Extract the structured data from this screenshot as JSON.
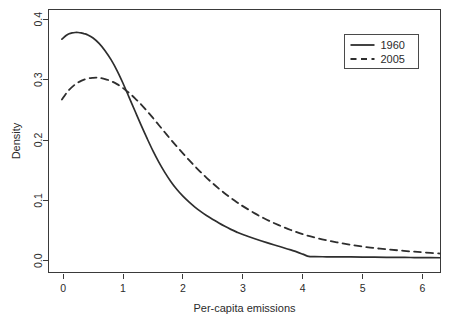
{
  "chart_data": {
    "type": "line",
    "title": "",
    "subtitle": "",
    "xlabel": "Per-capita emissions",
    "ylabel": "Density",
    "xlim": [
      -0.244,
      6.3
    ],
    "ylim": [
      -0.0194,
      0.4161
    ],
    "xticks": [
      0,
      1,
      2,
      3,
      4,
      5,
      6
    ],
    "xticklabels": [
      "0",
      "1",
      "2",
      "3",
      "4",
      "5",
      "6"
    ],
    "yticks": [
      0.0,
      0.1,
      0.2,
      0.3,
      0.4
    ],
    "yticklabels": [
      "0.0",
      "0.1",
      "0.2",
      "0.3",
      "0.4"
    ],
    "grid": false,
    "frame": true,
    "legend": {
      "position": "top-right",
      "entries": [
        {
          "label": "1960",
          "style": "solid"
        },
        {
          "label": "2005",
          "style": "dashed"
        }
      ]
    },
    "series": [
      {
        "name": "1960",
        "style": "solid",
        "color": "#2e2e2e",
        "x": [
          -0.02,
          0.05,
          0.1,
          0.15,
          0.2,
          0.25,
          0.3,
          0.35,
          0.4,
          0.5,
          0.6,
          0.7,
          0.8,
          0.9,
          1.0,
          1.1,
          1.2,
          1.3,
          1.4,
          1.5,
          1.6,
          1.7,
          1.8,
          1.9,
          2.0,
          2.1,
          2.2,
          2.3,
          2.4,
          2.5,
          2.6,
          2.7,
          2.8,
          2.9,
          3.0,
          3.2,
          3.4,
          3.6,
          3.8,
          4.0,
          4.1,
          4.2,
          4.4,
          4.6,
          4.8,
          5.0,
          5.2,
          5.4,
          5.6,
          5.8,
          6.0,
          6.3
        ],
        "y": [
          0.367,
          0.373,
          0.376,
          0.3775,
          0.378,
          0.378,
          0.3775,
          0.376,
          0.3745,
          0.369,
          0.36,
          0.348,
          0.333,
          0.315,
          0.294,
          0.271,
          0.248,
          0.225,
          0.203,
          0.182,
          0.163,
          0.146,
          0.131,
          0.118,
          0.107,
          0.0975,
          0.089,
          0.0815,
          0.0745,
          0.0685,
          0.0625,
          0.057,
          0.052,
          0.0475,
          0.0435,
          0.0365,
          0.03,
          0.024,
          0.018,
          0.011,
          0.0072,
          0.0068,
          0.0066,
          0.0065,
          0.0064,
          0.0062,
          0.006,
          0.0058,
          0.0056,
          0.0054,
          0.0052,
          0.005
        ]
      },
      {
        "name": "2005",
        "style": "dashed",
        "color": "#2e2e2e",
        "x": [
          -0.02,
          0.05,
          0.1,
          0.2,
          0.3,
          0.4,
          0.5,
          0.55,
          0.6,
          0.7,
          0.8,
          0.9,
          1.0,
          1.1,
          1.2,
          1.3,
          1.4,
          1.5,
          1.6,
          1.7,
          1.8,
          1.9,
          2.0,
          2.1,
          2.2,
          2.3,
          2.4,
          2.5,
          2.6,
          2.7,
          2.8,
          2.9,
          3.0,
          3.2,
          3.4,
          3.6,
          3.8,
          4.0,
          4.2,
          4.4,
          4.6,
          4.8,
          5.0,
          5.2,
          5.4,
          5.6,
          5.8,
          6.0,
          6.3
        ],
        "y": [
          0.267,
          0.277,
          0.283,
          0.292,
          0.298,
          0.3015,
          0.303,
          0.3033,
          0.303,
          0.301,
          0.2975,
          0.2925,
          0.286,
          0.278,
          0.269,
          0.259,
          0.248,
          0.2365,
          0.2245,
          0.2125,
          0.2005,
          0.189,
          0.178,
          0.167,
          0.1565,
          0.1465,
          0.137,
          0.128,
          0.1195,
          0.1115,
          0.104,
          0.097,
          0.0905,
          0.0785,
          0.068,
          0.059,
          0.051,
          0.044,
          0.0385,
          0.034,
          0.03,
          0.0265,
          0.0235,
          0.021,
          0.019,
          0.0172,
          0.0155,
          0.014,
          0.012
        ]
      }
    ]
  },
  "axes": {
    "xlabel": "Per-capita emissions",
    "ylabel": "Density"
  }
}
